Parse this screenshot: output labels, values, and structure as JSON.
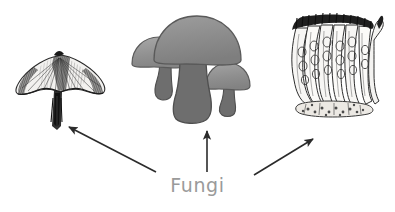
{
  "diagram": {
    "label": "Fungi",
    "label_color": "#9a9a9a",
    "background_color": "#ffffff",
    "line_color": "#2b2b2b",
    "figures": [
      {
        "id": "gilled-mushroom-engraving",
        "name": "gilled-mushroom-engraving",
        "style": "line-engraving",
        "description": "Gilled mushroom with broad fan-shaped cap and slender stalk",
        "position": "left",
        "ink_color": "#3a3a3a"
      },
      {
        "id": "mushroom-cluster-silhouette",
        "name": "mushroom-cluster-silhouette",
        "style": "flat-gray-silhouette",
        "description": "Cluster of three cap mushrooms",
        "position": "center",
        "cap_color": "#8c8c8c",
        "cap_highlight_color": "#a6a6a6",
        "stem_color": "#6e6e6e",
        "outline_color": "#5a5a5a"
      },
      {
        "id": "asci-cross-section-engraving",
        "name": "asci-cross-section-engraving",
        "style": "line-engraving",
        "description": "Microscopic cross section of spore-bearing asci with spores inside",
        "position": "right",
        "ink_color": "#3a3a3a"
      }
    ],
    "arrows": [
      {
        "id": "arrow-to-left-figure",
        "name": "arrow-to-left-figure",
        "from": [
          156,
          172
        ],
        "to": [
          67,
          126
        ],
        "direction": "up-left"
      },
      {
        "id": "arrow-to-center-figure",
        "name": "arrow-to-center-figure",
        "from": [
          207,
          172
        ],
        "to": [
          207,
          130
        ],
        "direction": "up"
      },
      {
        "id": "arrow-to-right-figure",
        "name": "arrow-to-right-figure",
        "from": [
          254,
          175
        ],
        "to": [
          315,
          138
        ],
        "direction": "up-right"
      }
    ]
  }
}
